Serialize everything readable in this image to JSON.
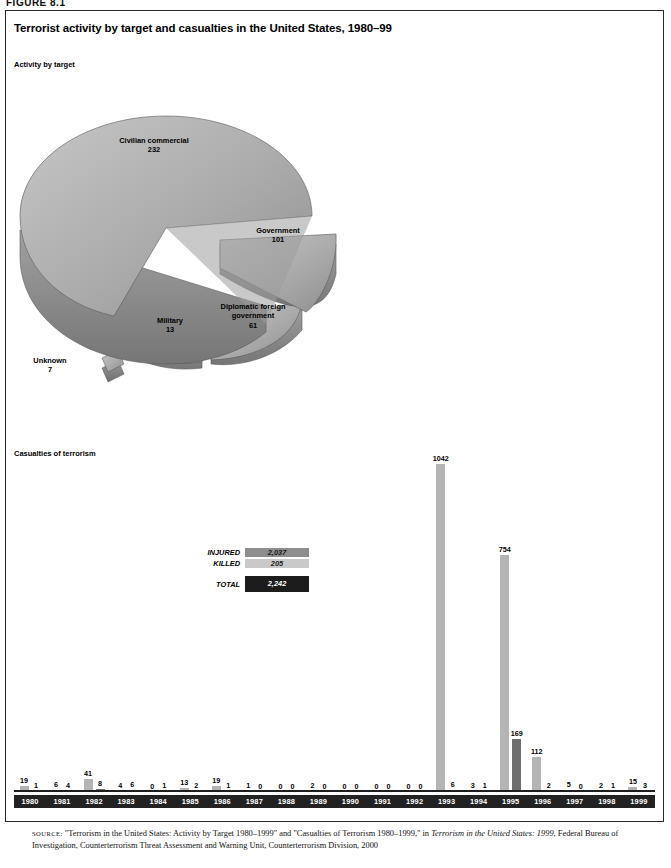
{
  "figure_label": "FIGURE 8.1",
  "title": "Terrorist activity by target and casualties in the United States, 1980–99",
  "section_a": "Activity by target",
  "section_b": "Casualties of terrorism",
  "legend": {
    "injured_label": "INJURED",
    "injured_value": "2,037",
    "killed_label": "KILLED",
    "killed_value": "205",
    "total_label": "TOTAL",
    "total_value": "2,242"
  },
  "source": {
    "prefix": "SOURCE:",
    "text_1": " \"Terrorism in the United States: Activity by Target 1980–1999\" and \"Casualties of Terrorism 1980–1999,\" in ",
    "italic_1": "Terrorism in the United States: 1999",
    "text_2": ", Federal Bureau of Investigation, Counterterrorism Threat Assessment and Warning Unit, Counterterrorism Division, 2000"
  },
  "chart_data": [
    {
      "type": "pie",
      "title": "Activity by target",
      "slices": [
        {
          "label": "Civilian commercial",
          "value": 232
        },
        {
          "label": "Government",
          "value": 101
        },
        {
          "label": "Diplomatic foreign government",
          "value": 61
        },
        {
          "label": "Military",
          "value": 13
        },
        {
          "label": "Unknown",
          "value": 7
        }
      ],
      "total": 414,
      "exploded": true,
      "style": "3d"
    },
    {
      "type": "bar",
      "title": "Casualties of terrorism",
      "categories": [
        "1980",
        "1981",
        "1982",
        "1983",
        "1984",
        "1985",
        "1986",
        "1987",
        "1988",
        "1989",
        "1990",
        "1991",
        "1992",
        "1993",
        "1994",
        "1995",
        "1996",
        "1997",
        "1998",
        "1999"
      ],
      "series": [
        {
          "name": "INJURED",
          "color": "#b4b4b4",
          "values": [
            19,
            6,
            41,
            4,
            0,
            13,
            19,
            1,
            0,
            2,
            0,
            0,
            0,
            1042,
            3,
            754,
            112,
            5,
            2,
            15
          ]
        },
        {
          "name": "KILLED",
          "color": "#6e6e6e",
          "values": [
            1,
            4,
            8,
            6,
            1,
            2,
            1,
            0,
            0,
            0,
            0,
            0,
            0,
            6,
            1,
            169,
            2,
            0,
            1,
            3
          ]
        }
      ],
      "xlabel": "",
      "ylabel": "",
      "ylim": [
        0,
        1042
      ],
      "grid": false,
      "legend_position": "inset-left"
    }
  ],
  "colors": {
    "injured": "#b4b4b4",
    "killed": "#6e6e6e",
    "legend_injured": "#8e8e8e",
    "legend_killed": "#c9c9c9",
    "legend_total": "#1c1c1c",
    "axis": "#1f1f1f"
  }
}
